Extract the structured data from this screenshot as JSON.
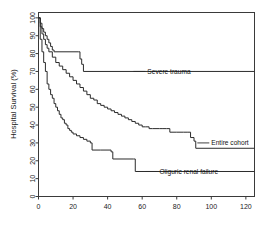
{
  "figure": {
    "background_color": "#ffffff",
    "line_color": "#2b2b2b",
    "axis_color": "#3a3a3a"
  },
  "chart_data": {
    "type": "line",
    "subtype": "kaplan-meier-survival-step",
    "title": "",
    "subtitle": "",
    "xlabel": "",
    "ylabel": "Hospital Survival (%)",
    "xlim": [
      0,
      125
    ],
    "ylim": [
      0,
      103
    ],
    "xticks": [
      0,
      20,
      40,
      60,
      80,
      100,
      120
    ],
    "xticklabels": [
      "0",
      "20",
      "40",
      "60",
      "80",
      "100",
      "120"
    ],
    "yticks": [
      0,
      10,
      20,
      30,
      40,
      50,
      60,
      70,
      80,
      90,
      100
    ],
    "yticklabels": [
      "0",
      "10",
      "20",
      "30",
      "40",
      "50",
      "60",
      "70",
      "80",
      "90",
      "100"
    ],
    "grid": false,
    "legend": "inline-annotations",
    "legend_position": "right-of-curves",
    "series": [
      {
        "name": "Severe trauma",
        "label": "Severe trauma",
        "label_value_at_end": 70,
        "x": [
          0,
          1,
          2,
          3,
          4,
          5,
          6,
          7,
          8,
          9,
          23,
          24,
          25,
          26,
          125
        ],
        "y": [
          100,
          97,
          94,
          92,
          90,
          88,
          86,
          84,
          82,
          81,
          81,
          77,
          74,
          70,
          70
        ]
      },
      {
        "name": "Entire cohort",
        "label": "Entire cohort",
        "label_value_at_end": 27,
        "x": [
          0,
          1,
          2,
          3,
          4,
          5,
          6,
          8,
          10,
          12,
          14,
          16,
          18,
          20,
          22,
          24,
          26,
          28,
          30,
          32,
          34,
          36,
          38,
          40,
          42,
          44,
          46,
          48,
          50,
          52,
          54,
          56,
          58,
          60,
          62,
          64,
          66,
          68,
          70,
          72,
          74,
          76,
          80,
          84,
          86,
          88,
          90,
          91,
          125
        ],
        "y": [
          100,
          95,
          91,
          88,
          85,
          83,
          81,
          78,
          75,
          73,
          71,
          69,
          67,
          65,
          63,
          61,
          59,
          57,
          55,
          54,
          52,
          51,
          50,
          49,
          48,
          47,
          46,
          45,
          44,
          43,
          42,
          41,
          40,
          39,
          39,
          38,
          38,
          38,
          38,
          38,
          38,
          36,
          36,
          36,
          36,
          33,
          31,
          27,
          27
        ]
      },
      {
        "name": "Oliguric renal failure",
        "label": "Oliguric renal failure",
        "label_value_at_end": 14,
        "x": [
          0,
          1,
          2,
          3,
          4,
          5,
          6,
          7,
          8,
          9,
          10,
          11,
          12,
          13,
          14,
          15,
          16,
          17,
          18,
          19,
          20,
          22,
          24,
          26,
          28,
          30,
          31,
          36,
          42,
          43,
          55,
          56,
          125
        ],
        "y": [
          100,
          88,
          81,
          75,
          70,
          63,
          60,
          57,
          55,
          52,
          50,
          48,
          46,
          44,
          43,
          41,
          40,
          38,
          37,
          36,
          35,
          34,
          33,
          32,
          31,
          30,
          26,
          26,
          25,
          21,
          21,
          14,
          14
        ]
      }
    ],
    "annotations": [
      {
        "text": "Severe trauma",
        "x_data": 63,
        "y_data": 70
      },
      {
        "text": "Entire cohort",
        "x_data": 100,
        "y_data": 30
      },
      {
        "text": "Oliguric renal failure",
        "x_data": 70,
        "y_data": 14
      }
    ]
  }
}
